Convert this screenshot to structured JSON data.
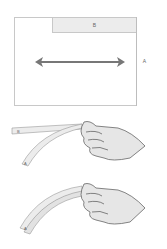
{
  "diagram": {
    "top_panel": {
      "label_b": "B",
      "label_a": "A",
      "arrow": "double-headed-horizontal-arrow"
    },
    "figure_1": {
      "strip_label_top": "B",
      "strip_label_bottom": "A"
    },
    "figure_2": {
      "strip_label": "A"
    }
  },
  "colors": {
    "outline": "#c8c8c8",
    "strip_fill": "#ececec",
    "arrow": "#777777",
    "hand_fill": "#e6e6e6",
    "hand_stroke": "#666666"
  }
}
